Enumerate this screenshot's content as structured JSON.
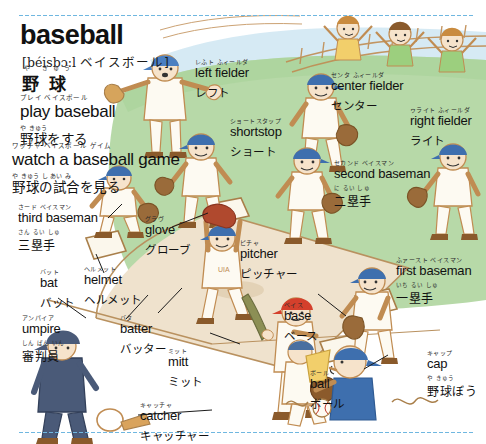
{
  "page": {
    "headword": "baseball",
    "phonetic_ipa": "[béisbɔ:l",
    "phonetic_kana": "ベイスボール]",
    "headword_furigana": "や きゅう",
    "headword_japanese": "野 球",
    "background_color": "#ffffff",
    "rule_color": "#6fb7e0",
    "field_grass_color": "#b7d9a8",
    "field_dirt_color": "#efe2cd",
    "sky_color": "#cfe6f2"
  },
  "phrases": [
    {
      "furigana": "プレイ  ベイスボール",
      "english": "play baseball",
      "jp_furigana": "や きゅう",
      "japanese": "野球をする"
    },
    {
      "furigana": "ワッチャ  ベイスボール  ゲイム",
      "english": "watch a baseball game",
      "jp_furigana": "や きゅう     し あい      み",
      "japanese": "野球の試合を見る"
    }
  ],
  "positions": [
    {
      "name": "left-fielder",
      "furigana": "レふト  ふィールダ",
      "english": "left fielder",
      "katakana": "レフト",
      "kanji_furigana": "",
      "kanji": ""
    },
    {
      "name": "center-fielder",
      "furigana": "センタ  ふィールダ",
      "english": "center fielder",
      "katakana": "センター",
      "kanji_furigana": "",
      "kanji": ""
    },
    {
      "name": "right-fielder",
      "furigana": "ゥライト  ふィールダ",
      "english": "right fielder",
      "katakana": "ライト",
      "kanji_furigana": "",
      "kanji": ""
    },
    {
      "name": "shortstop",
      "furigana": "ショートスタップ",
      "english": "shortstop",
      "katakana": "ショート",
      "kanji_furigana": "",
      "kanji": ""
    },
    {
      "name": "second-baseman",
      "furigana": "セカンド  ベイスマン",
      "english": "second baseman",
      "katakana": "",
      "kanji_furigana": "に るい しゅ",
      "kanji": "二塁手"
    },
    {
      "name": "third-baseman",
      "furigana": "さード  ベイスマン",
      "english": "third baseman",
      "katakana": "",
      "kanji_furigana": "さん るい しゅ",
      "kanji": "三塁手"
    },
    {
      "name": "first-baseman",
      "furigana": "ふァースト  ベイスマン",
      "english": "first baseman",
      "katakana": "",
      "kanji_furigana": "いち るい しゅ",
      "kanji": "一塁手"
    },
    {
      "name": "pitcher",
      "furigana": "ピチャ",
      "english": "pitcher",
      "katakana": "ピッチャー",
      "kanji_furigana": "",
      "kanji": ""
    },
    {
      "name": "batter",
      "furigana": "バタ",
      "english": "batter",
      "katakana": "バッター",
      "kanji_furigana": "",
      "kanji": ""
    },
    {
      "name": "catcher",
      "furigana": "キャッチャ",
      "english": "catcher",
      "katakana": "キャッチャー",
      "kanji_furigana": "",
      "kanji": ""
    },
    {
      "name": "umpire",
      "furigana": "アンパイア",
      "english": "umpire",
      "katakana": "",
      "kanji_furigana": "しん ぱん いん",
      "kanji": "審判員"
    }
  ],
  "equipment": [
    {
      "name": "glove",
      "furigana": "グラヴ",
      "english": "glove",
      "katakana": "グローブ",
      "kanji_furigana": "",
      "kanji": ""
    },
    {
      "name": "helmet",
      "furigana": "ヘルメット",
      "english": "helmet",
      "katakana": "ヘルメット",
      "kanji_furigana": "",
      "kanji": ""
    },
    {
      "name": "bat",
      "furigana": "バット",
      "english": "bat",
      "katakana": "バット",
      "kanji_furigana": "",
      "kanji": ""
    },
    {
      "name": "mitt",
      "furigana": "ミット",
      "english": "mitt",
      "katakana": "ミット",
      "kanji_furigana": "",
      "kanji": ""
    },
    {
      "name": "base",
      "furigana": "ベイス",
      "english": "base",
      "katakana": "ベース",
      "kanji_furigana": "",
      "kanji": ""
    },
    {
      "name": "ball",
      "furigana": "ボール",
      "english": "ball",
      "katakana": "ボール",
      "kanji_furigana": "",
      "kanji": ""
    },
    {
      "name": "cap",
      "furigana": "キャップ",
      "english": "cap",
      "katakana": "",
      "kanji_furigana": "や きゅう",
      "kanji": "野球ぼう"
    }
  ]
}
